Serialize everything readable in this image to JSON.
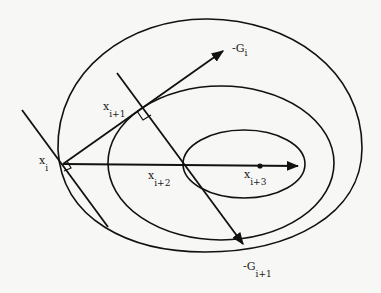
{
  "diagram": {
    "type": "steepest-descent-contour",
    "colors": {
      "background": "#f7f7f5",
      "stroke": "#111111"
    },
    "labels": {
      "x_i": {
        "base": "x",
        "sub": "i"
      },
      "x_i1": {
        "base": "x",
        "sub": "i+1"
      },
      "x_i2": {
        "base": "x",
        "sub": "i+2"
      },
      "x_i3": {
        "base": "x",
        "sub": "i+3"
      },
      "neg_g_i": {
        "base": "-G",
        "sub": "i"
      },
      "neg_g_i1": {
        "base": "-G",
        "sub": "i+1"
      }
    },
    "contours": [
      {
        "name": "outer",
        "cx": 210,
        "cy": 136,
        "rx": 152,
        "ry": 117
      },
      {
        "name": "middle",
        "cx": 221,
        "cy": 163,
        "rx": 113,
        "ry": 77
      },
      {
        "name": "inner",
        "cx": 244,
        "cy": 164,
        "rx": 61,
        "ry": 34
      }
    ],
    "points": {
      "x_i": [
        63,
        164
      ],
      "x_i1": [
        143,
        107
      ],
      "x_i2": [
        183,
        165
      ],
      "x_i3": [
        260,
        166
      ]
    }
  }
}
